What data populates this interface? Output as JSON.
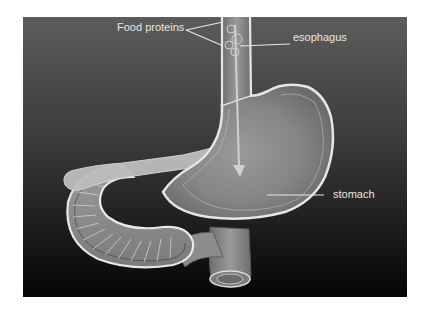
{
  "figure": {
    "labels": {
      "food_proteins": "Food proteins",
      "esophagus": "esophagus",
      "stomach": "stomach"
    },
    "colors": {
      "background_top": "#5c5c5c",
      "background_bottom": "#050505",
      "organ_fill": "#8a8a8a",
      "organ_outline": "#e0e0e0",
      "pancreas_fill": "#bdbdbd",
      "label_text": "#e6e6e6",
      "arrow": "#d0d0d0"
    }
  }
}
